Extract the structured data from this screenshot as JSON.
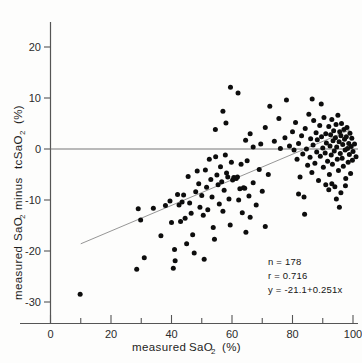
{
  "chart_data": {
    "type": "scatter",
    "title": "",
    "xlabel": "measured SaO2  (%)",
    "ylabel": "measured  SaO2  minus  tcSaO2  (%)",
    "xlim": [
      0,
      103
    ],
    "ylim": [
      -33,
      23
    ],
    "xticks": [
      0,
      20,
      40,
      60,
      80,
      100
    ],
    "xticklabels": [
      "0",
      "20",
      "40",
      "60",
      "80",
      "100"
    ],
    "xminorticks": [
      10,
      30,
      50,
      70,
      90
    ],
    "yticks": [
      20,
      10,
      0,
      -10,
      -20,
      -30
    ],
    "yticklabels": [
      "20",
      "10",
      "0",
      "-10",
      "-20",
      "-30"
    ],
    "grid": false,
    "legend": null,
    "zero_reference_line": 0,
    "fit_line": {
      "label": "y = -21.1+0.251x",
      "slope": 0.251,
      "intercept": -21.1,
      "x_start": 10,
      "x_end": 99
    },
    "annotations": {
      "n_label": "n = 178",
      "r_label": "r = 0.716",
      "equation_label": "y = -21.1+0.251x"
    },
    "axis_label_parts": {
      "x_prefix": "measured",
      "x_symbol": "SaO",
      "x_sub": "2",
      "x_units": "(%)",
      "y_prefix": "measured",
      "y_symbol1": "SaO",
      "y_sub1": "2",
      "y_middle": "minus",
      "y_symbol2": "tcSaO",
      "y_sub2": "2",
      "y_units": "(%)"
    },
    "points": [
      [
        9.8,
        -28.5
      ],
      [
        28.5,
        -23.6
      ],
      [
        29.0,
        -11.7
      ],
      [
        29.8,
        -13.9
      ],
      [
        31.0,
        -21.3
      ],
      [
        34.0,
        -11.6
      ],
      [
        36.5,
        -17.0
      ],
      [
        38.0,
        -11.1
      ],
      [
        39.5,
        -10.2
      ],
      [
        40.0,
        -14.4
      ],
      [
        40.6,
        -23.4
      ],
      [
        41.0,
        -19.7
      ],
      [
        41.2,
        -21.9
      ],
      [
        42.0,
        -8.9
      ],
      [
        42.5,
        -11.0
      ],
      [
        43.0,
        -14.2
      ],
      [
        43.5,
        -10.4
      ],
      [
        44.0,
        -9.0
      ],
      [
        44.5,
        -13.6
      ],
      [
        45.0,
        -18.6
      ],
      [
        45.5,
        -5.4
      ],
      [
        46.0,
        -10.6
      ],
      [
        46.5,
        -12.6
      ],
      [
        47.0,
        -16.8
      ],
      [
        47.5,
        -20.4
      ],
      [
        48.0,
        -8.4
      ],
      [
        48.5,
        -4.3
      ],
      [
        49.0,
        -6.8
      ],
      [
        49.4,
        -11.4
      ],
      [
        50.0,
        -9.1
      ],
      [
        50.5,
        -13.0
      ],
      [
        50.8,
        -21.6
      ],
      [
        51.2,
        -4.1
      ],
      [
        51.6,
        -7.5
      ],
      [
        52.0,
        -11.9
      ],
      [
        52.5,
        -2.0
      ],
      [
        53.0,
        -6.0
      ],
      [
        53.4,
        -9.4
      ],
      [
        53.8,
        -15.4
      ],
      [
        54.2,
        -17.7
      ],
      [
        54.6,
        -1.5
      ],
      [
        55.0,
        -5.1
      ],
      [
        55.4,
        -7.0
      ],
      [
        55.8,
        -10.8
      ],
      [
        56.2,
        -3.5
      ],
      [
        56.6,
        -6.4
      ],
      [
        57.0,
        -12.2
      ],
      [
        57.4,
        -8.1
      ],
      [
        57.8,
        -1.2
      ],
      [
        58.2,
        -4.7
      ],
      [
        58.6,
        -5.5
      ],
      [
        59.0,
        -9.8
      ],
      [
        59.4,
        -14.9
      ],
      [
        59.8,
        -2.6
      ],
      [
        60.2,
        -6.1
      ],
      [
        60.6,
        -5.6
      ],
      [
        61.0,
        -5.7
      ],
      [
        61.4,
        -5.8
      ],
      [
        61.8,
        -5.5
      ],
      [
        62.2,
        -10.0
      ],
      [
        62.6,
        -7.8
      ],
      [
        63.0,
        -3.0
      ],
      [
        63.4,
        -12.5
      ],
      [
        63.8,
        -7.6
      ],
      [
        64.2,
        -7.7
      ],
      [
        64.6,
        -16.3
      ],
      [
        65.0,
        -2.3
      ],
      [
        65.6,
        -9.2
      ],
      [
        66.0,
        -13.4
      ],
      [
        67.0,
        -6.6
      ],
      [
        68.0,
        -11.0
      ],
      [
        69.0,
        -4.0
      ],
      [
        70.0,
        -8.3
      ],
      [
        71.0,
        -15.2
      ],
      [
        72.0,
        -5.0
      ],
      [
        54.5,
        3.8
      ],
      [
        57.0,
        7.4
      ],
      [
        58.0,
        5.1
      ],
      [
        59.5,
        12.1
      ],
      [
        62.0,
        11.0
      ],
      [
        64.5,
        1.7
      ],
      [
        66.0,
        3.0
      ],
      [
        67.0,
        0.4
      ],
      [
        69.5,
        1.0
      ],
      [
        71.0,
        4.2
      ],
      [
        72.5,
        8.4
      ],
      [
        74.0,
        1.5
      ],
      [
        75.5,
        6.0
      ],
      [
        76.0,
        0.1
      ],
      [
        77.5,
        2.2
      ],
      [
        78.0,
        9.6
      ],
      [
        79.0,
        0.6
      ],
      [
        80.0,
        3.4
      ],
      [
        80.5,
        -0.2
      ],
      [
        81.0,
        5.2
      ],
      [
        81.5,
        -2.0
      ],
      [
        82.0,
        1.1
      ],
      [
        82.5,
        -5.5
      ],
      [
        83.0,
        2.6
      ],
      [
        83.4,
        -1.0
      ],
      [
        83.8,
        -9.4
      ],
      [
        84.2,
        4.0
      ],
      [
        84.6,
        0.0
      ],
      [
        85.0,
        -3.2
      ],
      [
        85.4,
        6.8
      ],
      [
        85.8,
        -1.6
      ],
      [
        86.0,
        2.0
      ],
      [
        86.4,
        -4.6
      ],
      [
        86.8,
        0.8
      ],
      [
        87.0,
        5.6
      ],
      [
        87.4,
        -2.8
      ],
      [
        87.8,
        3.2
      ],
      [
        88.0,
        -0.6
      ],
      [
        88.2,
        1.8
      ],
      [
        88.6,
        -6.2
      ],
      [
        89.0,
        4.6
      ],
      [
        89.2,
        -1.4
      ],
      [
        89.6,
        2.4
      ],
      [
        90.0,
        0.2
      ],
      [
        90.2,
        -3.6
      ],
      [
        90.4,
        6.2
      ],
      [
        90.8,
        -0.8
      ],
      [
        91.0,
        3.0
      ],
      [
        91.2,
        1.2
      ],
      [
        91.6,
        -2.4
      ],
      [
        92.0,
        4.4
      ],
      [
        92.2,
        -5.0
      ],
      [
        92.4,
        0.6
      ],
      [
        92.6,
        2.8
      ],
      [
        92.8,
        -1.2
      ],
      [
        93.0,
        5.8
      ],
      [
        93.2,
        -3.0
      ],
      [
        93.4,
        1.6
      ],
      [
        93.6,
        3.6
      ],
      [
        93.8,
        -0.4
      ],
      [
        94.0,
        -7.4
      ],
      [
        94.2,
        2.2
      ],
      [
        94.4,
        4.8
      ],
      [
        94.6,
        0.4
      ],
      [
        94.8,
        -2.0
      ],
      [
        95.0,
        6.6
      ],
      [
        95.2,
        -4.2
      ],
      [
        95.4,
        1.4
      ],
      [
        95.6,
        3.4
      ],
      [
        95.8,
        -0.9
      ],
      [
        96.0,
        2.6
      ],
      [
        96.2,
        5.0
      ],
      [
        96.4,
        -1.8
      ],
      [
        96.6,
        0.9
      ],
      [
        96.8,
        -3.4
      ],
      [
        97.0,
        3.8
      ],
      [
        97.2,
        1.9
      ],
      [
        97.4,
        -0.2
      ],
      [
        97.6,
        -5.8
      ],
      [
        97.8,
        2.4
      ],
      [
        98.0,
        4.2
      ],
      [
        98.2,
        0.1
      ],
      [
        98.4,
        -2.6
      ],
      [
        98.6,
        1.1
      ],
      [
        98.8,
        -1.1
      ],
      [
        99.0,
        3.1
      ],
      [
        99.2,
        -4.8
      ],
      [
        99.4,
        0.5
      ],
      [
        99.6,
        2.1
      ],
      [
        99.8,
        -2.2
      ],
      [
        100.0,
        -0.5
      ],
      [
        96.0,
        -8.6
      ],
      [
        94.5,
        -9.8
      ],
      [
        92.0,
        -8.0
      ],
      [
        95.5,
        -11.4
      ],
      [
        93.0,
        -6.8
      ],
      [
        97.5,
        -7.2
      ],
      [
        91.0,
        -7.0
      ],
      [
        89.5,
        8.8
      ],
      [
        86.5,
        9.8
      ],
      [
        100.5,
        1.0
      ],
      [
        101.0,
        -1.5
      ],
      [
        84.0,
        -12.8
      ],
      [
        82.0,
        -8.8
      ]
    ]
  }
}
